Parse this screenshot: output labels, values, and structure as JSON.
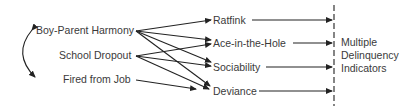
{
  "diagram": {
    "exogenous": [
      {
        "id": "bph",
        "label": "Boy-Parent Harmony"
      },
      {
        "id": "sd",
        "label": "School Dropout"
      },
      {
        "id": "ffj",
        "label": "Fired from Job"
      }
    ],
    "mediators": [
      {
        "id": "rat",
        "label": "Ratfink"
      },
      {
        "id": "ace",
        "label": "Ace-in-the-Hole"
      },
      {
        "id": "soc",
        "label": "Sociability"
      },
      {
        "id": "dev",
        "label": "Deviance"
      }
    ],
    "outcome": {
      "line1": "Multiple",
      "line2": "Delinquency",
      "line3": "Indicators"
    },
    "edges": [
      [
        "bph",
        "rat"
      ],
      [
        "bph",
        "ace"
      ],
      [
        "bph",
        "soc"
      ],
      [
        "bph",
        "dev"
      ],
      [
        "sd",
        "ace"
      ],
      [
        "sd",
        "soc"
      ],
      [
        "sd",
        "dev"
      ],
      [
        "ffj",
        "dev"
      ],
      [
        "rat",
        "outcome"
      ],
      [
        "ace",
        "outcome"
      ],
      [
        "soc",
        "outcome"
      ],
      [
        "dev",
        "outcome"
      ]
    ],
    "correlation": [
      "bph",
      "ffj"
    ]
  }
}
